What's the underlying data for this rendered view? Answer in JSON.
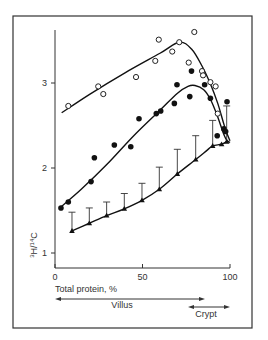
{
  "chart_data": {
    "type": "scatter",
    "title": "",
    "xlabel": "Total protein, %",
    "ylabel": "3H/14C",
    "ylabel_display": {
      "h_sup": "3",
      "h": "H",
      "slash": "/",
      "c_sup": "14",
      "c": "C"
    },
    "xlim": [
      0,
      100
    ],
    "ylim": [
      0.82,
      3.62
    ],
    "x_ticks": [
      0,
      50,
      100
    ],
    "x_tick_labels": [
      "0",
      "50",
      "100"
    ],
    "y_ticks": [
      1,
      2,
      3
    ],
    "y_tick_labels": [
      "1",
      "2",
      "3"
    ],
    "grid": false,
    "legend": null,
    "annotations": [
      {
        "label": "Villus",
        "from": 0,
        "to": 85,
        "direction": "both"
      },
      {
        "label": "Crypt",
        "from": 75,
        "to": 100,
        "direction": "both"
      }
    ],
    "series": [
      {
        "name": "open circles",
        "marker": "open-circle",
        "points": [
          [
            7.6,
            2.73
          ],
          [
            24.7,
            2.96
          ],
          [
            27.6,
            2.87
          ],
          [
            46.3,
            3.07
          ],
          [
            57.3,
            3.26
          ],
          [
            59.3,
            3.51
          ],
          [
            67.0,
            3.37
          ],
          [
            71.0,
            3.48
          ],
          [
            79.6,
            3.6
          ],
          [
            76.4,
            3.24
          ],
          [
            84.0,
            3.14
          ],
          [
            84.6,
            3.09
          ],
          [
            88.8,
            3.01
          ],
          [
            91.8,
            2.96
          ],
          [
            93.0,
            2.64
          ]
        ],
        "fit_curve": [
          [
            3.8,
            2.65
          ],
          [
            20,
            2.87
          ],
          [
            40,
            3.12
          ],
          [
            60,
            3.35
          ],
          [
            71,
            3.48
          ],
          [
            78,
            3.4
          ],
          [
            84,
            3.2
          ],
          [
            89,
            2.98
          ],
          [
            93,
            2.76
          ],
          [
            96,
            2.55
          ],
          [
            98,
            2.42
          ],
          [
            100,
            2.32
          ]
        ]
      },
      {
        "name": "filled circles",
        "marker": "filled-circle",
        "points": [
          [
            3.4,
            1.53
          ],
          [
            7.6,
            1.6
          ],
          [
            20.6,
            1.84
          ],
          [
            22.5,
            2.12
          ],
          [
            33.9,
            2.27
          ],
          [
            43.3,
            2.25
          ],
          [
            48.0,
            2.58
          ],
          [
            57.9,
            2.64
          ],
          [
            60.4,
            2.67
          ],
          [
            68.2,
            2.76
          ],
          [
            69.7,
            2.98
          ],
          [
            77.0,
            2.84
          ],
          [
            78.0,
            3.14
          ],
          [
            85.5,
            2.98
          ],
          [
            88.8,
            2.82
          ],
          [
            92.7,
            2.38
          ],
          [
            96.5,
            2.46
          ],
          [
            97.5,
            2.43
          ],
          [
            98.3,
            2.78
          ]
        ],
        "fit_curve": [
          [
            3.8,
            1.55
          ],
          [
            15,
            1.75
          ],
          [
            30,
            2.05
          ],
          [
            45,
            2.38
          ],
          [
            60,
            2.68
          ],
          [
            70,
            2.88
          ],
          [
            76,
            2.96
          ],
          [
            80,
            2.97
          ],
          [
            85,
            2.92
          ],
          [
            89,
            2.8
          ],
          [
            93,
            2.6
          ],
          [
            96,
            2.42
          ],
          [
            98,
            2.33
          ],
          [
            100,
            2.3
          ]
        ]
      },
      {
        "name": "triangles (mean ± SE)",
        "marker": "filled-triangle",
        "points": [
          [
            9.7,
            1.26
          ],
          [
            19.6,
            1.35
          ],
          [
            29.5,
            1.44
          ],
          [
            39.6,
            1.52
          ],
          [
            49.7,
            1.62
          ],
          [
            59.6,
            1.75
          ],
          [
            69.9,
            1.93
          ],
          [
            80.4,
            2.1
          ],
          [
            90.1,
            2.26
          ],
          [
            95.2,
            2.28
          ],
          [
            98.1,
            2.31
          ]
        ],
        "error_upper": [
          1.48,
          1.53,
          1.6,
          1.7,
          1.82,
          2.01,
          2.22,
          2.38,
          2.56,
          null,
          2.73
        ],
        "fit_curve": [
          [
            9.7,
            1.26
          ],
          [
            19.6,
            1.35
          ],
          [
            29.5,
            1.44
          ],
          [
            39.6,
            1.52
          ],
          [
            49.7,
            1.62
          ],
          [
            59.6,
            1.75
          ],
          [
            69.9,
            1.93
          ],
          [
            80.4,
            2.1
          ],
          [
            87,
            2.21
          ],
          [
            90.1,
            2.26
          ],
          [
            95.2,
            2.28
          ],
          [
            98.1,
            2.31
          ]
        ]
      }
    ]
  },
  "axes": {
    "x_label": "Total protein, %",
    "villus_label": "Villus",
    "crypt_label": "Crypt"
  }
}
